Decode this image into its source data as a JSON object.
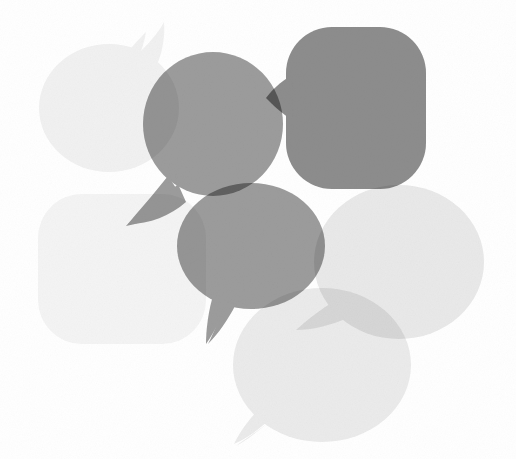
{
  "artwork": {
    "title": "Overlapping Speech Bubbles",
    "description": "Six grayscale speech bubbles of varying tone overlapping with a multiply blend on a white background",
    "width": 516,
    "height": 459,
    "background_color": "#ffffff",
    "blend_mode": "multiply",
    "texture": "fine grain noise"
  },
  "palette": {
    "background": "#ffffff",
    "very_light_gray": "#f1f1f1",
    "light_gray": "#e6e6e6",
    "mid_gray": "#9a9a9a",
    "dark_gray": "#868686",
    "darkest_overlap": "#4d4d4d"
  },
  "bubbles": [
    {
      "id": "bubble-top-left",
      "name": "light-ellipse-top-left",
      "shape": "ellipse",
      "fill": "#f1f1f1",
      "cx": 109,
      "cy": 108,
      "rx": 70,
      "ry": 64,
      "tail": "up-right",
      "z": 1
    },
    {
      "id": "bubble-bottom-left",
      "name": "faint-rounded-square-bottom-left",
      "shape": "rounded-square",
      "fill": "#f4f4f4",
      "x": 38,
      "y": 194,
      "width": 168,
      "height": 150,
      "radius": 44,
      "tail": "none",
      "z": 2
    },
    {
      "id": "bubble-right",
      "name": "light-ellipse-right",
      "shape": "ellipse",
      "fill": "#e9e9e9",
      "cx": 399,
      "cy": 262,
      "rx": 85,
      "ry": 77,
      "tail": "down-left",
      "z": 3
    },
    {
      "id": "bubble-bottom-right",
      "name": "light-ellipse-bottom-right",
      "shape": "ellipse",
      "fill": "#ebebeb",
      "cx": 322,
      "cy": 365,
      "rx": 89,
      "ry": 77,
      "tail": "down-left",
      "z": 4
    },
    {
      "id": "bubble-top-center",
      "name": "mid-gray-ellipse-top-center",
      "shape": "ellipse",
      "fill": "#9c9c9c",
      "cx": 213,
      "cy": 124,
      "rx": 70,
      "ry": 72,
      "tail": "down-left",
      "z": 5
    },
    {
      "id": "bubble-top-right",
      "name": "dark-rounded-square-top-right",
      "shape": "rounded-square",
      "fill": "#8d8d8d",
      "x": 286,
      "y": 27,
      "width": 140,
      "height": 162,
      "radius": 46,
      "tail": "left",
      "z": 6
    },
    {
      "id": "bubble-center",
      "name": "mid-gray-ellipse-center",
      "shape": "ellipse",
      "fill": "#9c9c9c",
      "cx": 251,
      "cy": 246,
      "rx": 74,
      "ry": 63,
      "tail": "down-left",
      "z": 7
    }
  ],
  "labels": {
    "canvas": "speech-bubble-illustration",
    "alt_text": "Cluster of seven overlapping translucent speech bubbles in shades of gray"
  }
}
